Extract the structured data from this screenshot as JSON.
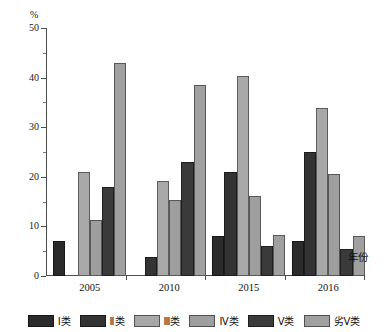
{
  "chart_data": {
    "type": "bar",
    "title": "",
    "subtitle": "",
    "xlabel": "年份",
    "ylabel": "%",
    "unit_label": "%",
    "grid": false,
    "legend_position": "bottom",
    "ylim": [
      0,
      50
    ],
    "y_ticks": [
      0,
      10,
      20,
      30,
      40,
      50
    ],
    "y_minor_ticks": [
      5,
      15,
      25,
      35,
      45
    ],
    "categories": [
      "2005",
      "2010",
      "2015",
      "2016"
    ],
    "series": [
      {
        "name": "I类",
        "color": "#2b2b2b",
        "values": [
          7.0,
          0.0,
          8.0,
          7.0
        ]
      },
      {
        "name": "Ⅱ类",
        "color": "#333333",
        "values": [
          0.0,
          3.8,
          21.0,
          25.0
        ]
      },
      {
        "name": "Ⅲ类",
        "color": "#a8a8a8",
        "values": [
          21.0,
          19.1,
          40.3,
          33.9
        ]
      },
      {
        "name": "Ⅳ类",
        "color": "#9e9e9e",
        "values": [
          11.2,
          15.4,
          16.1,
          20.6
        ]
      },
      {
        "name": "V类",
        "color": "#3a3a3a",
        "values": [
          18.0,
          23.0,
          6.1,
          5.4
        ]
      },
      {
        "name": "劣V类",
        "color": "#a0a0a0",
        "values": [
          43.0,
          38.6,
          8.2,
          8.1
        ]
      }
    ]
  },
  "axes": {
    "y_tick_labels": [
      "0",
      "10",
      "20",
      "30",
      "40",
      "50"
    ],
    "x_tick_labels": [
      "2005",
      "2010",
      "2015",
      "2016"
    ],
    "unit": "%",
    "x_title": "年份"
  },
  "legend": {
    "items": [
      {
        "label": "I类",
        "color": "#2b2b2b"
      },
      {
        "label": "Ⅱ类",
        "color": "#333333"
      },
      {
        "label": "Ⅲ类",
        "color": "#a8a8a8"
      },
      {
        "label": "Ⅳ类",
        "color": "#9e9e9e"
      },
      {
        "label": "V类",
        "color": "#3a3a3a"
      },
      {
        "label": "劣V类",
        "color": "#a0a0a0"
      }
    ]
  }
}
